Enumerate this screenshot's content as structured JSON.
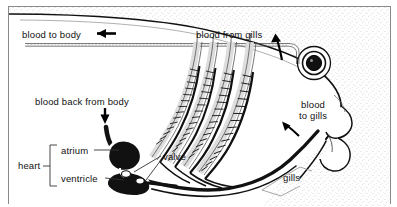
{
  "figure": {
    "border_color": "#8a8a8a",
    "background_color": "#ffffff",
    "ink_color": "#000000"
  },
  "labels": {
    "blood_to_body": "blood to body",
    "blood_from_gills": "blood from gills",
    "blood_back_from_body": "blood back from body",
    "blood_to_gills": "blood\nto gills",
    "blood_to_gills_line1": "blood",
    "blood_to_gills_line2": "to gills",
    "heart": "heart",
    "atrium": "atrium",
    "ventricle": "ventricle",
    "valve": "valve",
    "gills": "gills"
  },
  "anatomy": {
    "gill_arch_count": 4,
    "eye": "fish-eye",
    "chambers": [
      "atrium",
      "ventricle"
    ],
    "vessels": [
      "dorsal-aorta",
      "ventral-aorta",
      "sinus-venosus-inflow"
    ]
  },
  "arrows": {
    "blood_to_body_direction": "left",
    "blood_from_gills_direction": "up",
    "blood_back_from_body_direction": "down",
    "blood_to_gills_direction": "up-left"
  }
}
